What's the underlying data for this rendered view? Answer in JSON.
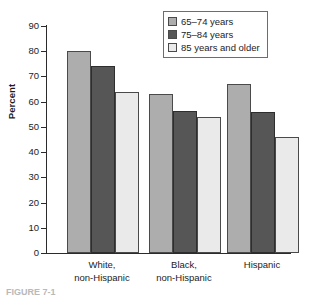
{
  "chart_data": {
    "type": "bar",
    "title": "",
    "xlabel": "",
    "ylabel": "Percent",
    "ylim": [
      0,
      90
    ],
    "ytick_step": 10,
    "yticks": [
      90,
      80,
      70,
      60,
      50,
      40,
      30,
      20,
      10,
      0
    ],
    "grid": false,
    "legend_position": "top-right",
    "categories": [
      "White,\nnon-Hispanic",
      "Black,\nnon-Hispanic",
      "Hispanic"
    ],
    "category_lines": [
      [
        "White,",
        "non-Hispanic"
      ],
      [
        "Black,",
        "non-Hispanic"
      ],
      [
        "Hispanic",
        ""
      ]
    ],
    "series": [
      {
        "name": "65–74 years",
        "color": "#adadad",
        "values": [
          80,
          63,
          67
        ]
      },
      {
        "name": "75–84 years",
        "color": "#565656",
        "values": [
          74,
          56.5,
          56
        ]
      },
      {
        "name": "85 years and older",
        "color": "#eaeaea",
        "values": [
          64,
          54,
          46
        ]
      }
    ]
  },
  "legend": {
    "items": [
      {
        "label": "65–74 years"
      },
      {
        "label": "75–84 years"
      },
      {
        "label": "85 years and older"
      }
    ]
  },
  "axis": {
    "y_title": "Percent",
    "y_ticks": [
      "90",
      "80",
      "70",
      "60",
      "50",
      "40",
      "30",
      "20",
      "10",
      "0"
    ]
  },
  "caption": {
    "text": "FIGURE 7-1"
  }
}
